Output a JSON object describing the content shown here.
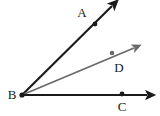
{
  "figure": {
    "canvas": {
      "width": 160,
      "height": 116,
      "background": "#ffffff"
    },
    "colors": {
      "ray_black": "#1a1a1a",
      "ray_gray": "#6a6a6a",
      "label_text": "#1a1a1a"
    },
    "vertex": {
      "name": "B",
      "label": "B",
      "x": 22,
      "y": 95,
      "label_x": 12,
      "label_y": 94
    },
    "rays": [
      {
        "id": "ray-ba",
        "from": "B",
        "to": "A",
        "color": "#1a1a1a",
        "stroke_width": 2.1,
        "tip_x": 114,
        "tip_y": 4,
        "arrowhead": true
      },
      {
        "id": "ray-bd",
        "from": "B",
        "to": "D",
        "color": "#6a6a6a",
        "stroke_width": 1.8,
        "tip_x": 137,
        "tip_y": 46,
        "arrowhead": true
      },
      {
        "id": "ray-bc",
        "from": "B",
        "to": "C",
        "color": "#1a1a1a",
        "stroke_width": 2.0,
        "tip_x": 151,
        "tip_y": 95,
        "arrowhead": true
      }
    ],
    "points": [
      {
        "id": "point-a",
        "name": "A",
        "label": "A",
        "x": 95,
        "y": 24,
        "dot_color": "#1a1a1a",
        "dot_radius": 2.4,
        "label_x": 82,
        "label_y": 12
      },
      {
        "id": "point-d",
        "name": "D",
        "label": "D",
        "x": 112,
        "y": 53,
        "dot_color": "#6a6a6a",
        "dot_radius": 2.3,
        "label_x": 119,
        "label_y": 67
      },
      {
        "id": "point-c",
        "name": "C",
        "label": "C",
        "x": 122,
        "y": 94,
        "dot_color": "#1a1a1a",
        "dot_radius": 2.4,
        "label_x": 122,
        "label_y": 106
      }
    ]
  }
}
